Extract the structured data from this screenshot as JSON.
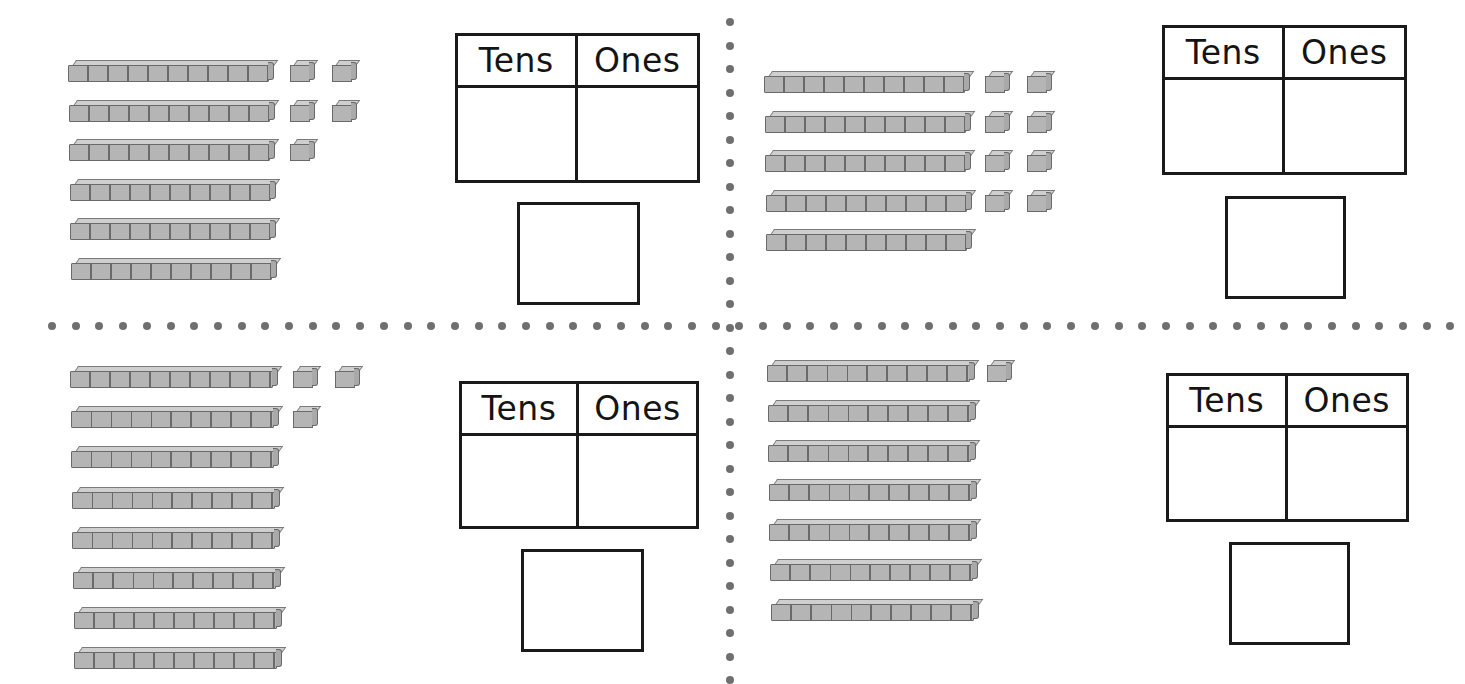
{
  "worksheet": {
    "chart_headers": {
      "tens": "Tens",
      "ones": "Ones"
    },
    "problems": [
      {
        "id": "top-left",
        "rods": 6,
        "unit_cube_rows": [
          2,
          2,
          1
        ],
        "units": 5,
        "tens_value": "",
        "ones_value": "",
        "answer": ""
      },
      {
        "id": "top-right",
        "rods": 5,
        "unit_cube_rows": [
          2,
          2,
          2,
          2
        ],
        "units": 8,
        "tens_value": "",
        "ones_value": "",
        "answer": ""
      },
      {
        "id": "bottom-left",
        "rods": 8,
        "unit_cube_rows": [
          2,
          1
        ],
        "units": 3,
        "tens_value": "",
        "ones_value": "",
        "answer": ""
      },
      {
        "id": "bottom-right",
        "rods": 7,
        "unit_cube_rows": [
          1
        ],
        "units": 1,
        "tens_value": "",
        "ones_value": "",
        "answer": ""
      }
    ],
    "colors": {
      "block_fill": "#b5b5b5",
      "block_outline": "#6a6a6a",
      "line": "#1a1a1a",
      "divider_dot": "#6f6f6f"
    }
  }
}
